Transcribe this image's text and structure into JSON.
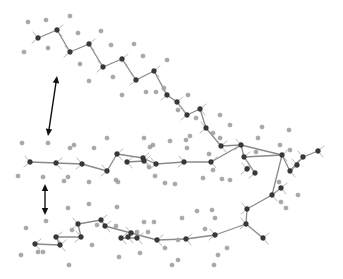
{
  "figure": {
    "type": "ball-and-stick molecular structure",
    "colors": {
      "background": "#ffffff",
      "carbon": "#3a3a3a",
      "hydrogen": "#a8a8a8",
      "bond": "#8a8a8a",
      "arrow": "#111111"
    }
  },
  "arrows": [
    {
      "name": "spacing-arrow-upper",
      "x1": 57,
      "y1": 76,
      "x2": 48,
      "y2": 136
    },
    {
      "name": "spacing-arrow-lower",
      "x1": 45,
      "y1": 184,
      "x2": 45,
      "y2": 215
    }
  ],
  "chains": [
    {
      "name": "top-chain",
      "carbons": [
        [
          38,
          38
        ],
        [
          57,
          30
        ],
        [
          70,
          52
        ],
        [
          89,
          44
        ],
        [
          103,
          67
        ],
        [
          122,
          59
        ],
        [
          136,
          80
        ],
        [
          154,
          71
        ],
        [
          167,
          95
        ],
        [
          177,
          102
        ],
        [
          187,
          115
        ],
        [
          200,
          109
        ],
        [
          206,
          128
        ],
        [
          221,
          146
        ]
      ],
      "hydrogens": [
        [
          28,
          22
        ],
        [
          46,
          20
        ],
        [
          70,
          16
        ],
        [
          24,
          52
        ],
        [
          48,
          48
        ],
        [
          78,
          33
        ],
        [
          101,
          31
        ],
        [
          80,
          64
        ],
        [
          111,
          45
        ],
        [
          134,
          44
        ],
        [
          89,
          81
        ],
        [
          113,
          77
        ],
        [
          122,
          95
        ],
        [
          143,
          56
        ],
        [
          167,
          60
        ],
        [
          146,
          92
        ],
        [
          156,
          92
        ],
        [
          164,
          88
        ],
        [
          178,
          110
        ],
        [
          188,
          95
        ],
        [
          190,
          136
        ],
        [
          196,
          118
        ],
        [
          220,
          115
        ],
        [
          213,
          133
        ],
        [
          230,
          125
        ]
      ]
    },
    {
      "name": "middle-chain",
      "carbons": [
        [
          30,
          162
        ],
        [
          56,
          163
        ],
        [
          82,
          164
        ],
        [
          107,
          171
        ],
        [
          117,
          154
        ],
        [
          127,
          162
        ],
        [
          143,
          158
        ],
        [
          144,
          161
        ],
        [
          156,
          164
        ],
        [
          184,
          162
        ],
        [
          211,
          162
        ],
        [
          241,
          145
        ],
        [
          244,
          157
        ],
        [
          247,
          169
        ],
        [
          255,
          173
        ],
        [
          282,
          155
        ],
        [
          290,
          171
        ],
        [
          297,
          165
        ],
        [
          303,
          157
        ],
        [
          318,
          151
        ],
        [
          272,
          195
        ],
        [
          281,
          188
        ]
      ],
      "hydrogens": [
        [
          22,
          143
        ],
        [
          48,
          143
        ],
        [
          18,
          176
        ],
        [
          43,
          177
        ],
        [
          70,
          148
        ],
        [
          74,
          145
        ],
        [
          64,
          181
        ],
        [
          68,
          177
        ],
        [
          89,
          182
        ],
        [
          94,
          148
        ],
        [
          107,
          138
        ],
        [
          116,
          180
        ],
        [
          118,
          182
        ],
        [
          144,
          138
        ],
        [
          150,
          147
        ],
        [
          149,
          167
        ],
        [
          155,
          176
        ],
        [
          153,
          145
        ],
        [
          165,
          183
        ],
        [
          175,
          184
        ],
        [
          170,
          141
        ],
        [
          187,
          148
        ],
        [
          203,
          178
        ],
        [
          186,
          140
        ],
        [
          209,
          154
        ],
        [
          213,
          170
        ],
        [
          220,
          138
        ],
        [
          222,
          179
        ],
        [
          230,
          180
        ],
        [
          258,
          138
        ],
        [
          256,
          152
        ],
        [
          262,
          127
        ],
        [
          280,
          145
        ],
        [
          289,
          130
        ],
        [
          290,
          150
        ],
        [
          279,
          182
        ],
        [
          286,
          208
        ],
        [
          298,
          195
        ],
        [
          281,
          202
        ],
        [
          248,
          168
        ]
      ]
    },
    {
      "name": "bottom-chain",
      "carbons": [
        [
          35,
          244
        ],
        [
          56,
          237
        ],
        [
          60,
          245
        ],
        [
          78,
          224
        ],
        [
          81,
          237
        ],
        [
          101,
          220
        ],
        [
          105,
          226
        ],
        [
          121,
          238
        ],
        [
          128,
          237
        ],
        [
          131,
          233
        ],
        [
          137,
          238
        ],
        [
          157,
          240
        ],
        [
          186,
          239
        ],
        [
          215,
          235
        ],
        [
          246,
          224
        ],
        [
          247,
          209
        ],
        [
          263,
          238
        ]
      ],
      "hydrogens": [
        [
          26,
          228
        ],
        [
          21,
          255
        ],
        [
          38,
          252
        ],
        [
          43,
          252
        ],
        [
          46,
          221
        ],
        [
          68,
          208
        ],
        [
          69,
          265
        ],
        [
          72,
          230
        ],
        [
          89,
          204
        ],
        [
          92,
          245
        ],
        [
          97,
          225
        ],
        [
          117,
          207
        ],
        [
          116,
          226
        ],
        [
          119,
          257
        ],
        [
          140,
          253
        ],
        [
          144,
          222
        ],
        [
          148,
          232
        ],
        [
          154,
          222
        ],
        [
          137,
          232
        ],
        [
          165,
          248
        ],
        [
          178,
          240
        ],
        [
          182,
          218
        ],
        [
          197,
          211
        ],
        [
          205,
          229
        ],
        [
          212,
          210
        ],
        [
          215,
          218
        ],
        [
          218,
          255
        ],
        [
          214,
          265
        ],
        [
          172,
          265
        ],
        [
          178,
          260
        ],
        [
          227,
          248
        ]
      ]
    }
  ],
  "bonds": [
    [
      38,
      38,
      57,
      30
    ],
    [
      57,
      30,
      70,
      52
    ],
    [
      70,
      52,
      89,
      44
    ],
    [
      89,
      44,
      103,
      67
    ],
    [
      103,
      67,
      122,
      59
    ],
    [
      122,
      59,
      136,
      80
    ],
    [
      136,
      80,
      154,
      71
    ],
    [
      154,
      71,
      167,
      95
    ],
    [
      167,
      95,
      177,
      102
    ],
    [
      177,
      102,
      187,
      115
    ],
    [
      187,
      115,
      200,
      109
    ],
    [
      200,
      109,
      206,
      128
    ],
    [
      206,
      128,
      221,
      146
    ],
    [
      221,
      146,
      241,
      145
    ],
    [
      30,
      162,
      56,
      163
    ],
    [
      56,
      163,
      82,
      164
    ],
    [
      82,
      164,
      107,
      171
    ],
    [
      107,
      171,
      117,
      154
    ],
    [
      117,
      154,
      143,
      158
    ],
    [
      127,
      162,
      144,
      161
    ],
    [
      143,
      158,
      156,
      164
    ],
    [
      156,
      164,
      184,
      162
    ],
    [
      184,
      162,
      211,
      162
    ],
    [
      211,
      162,
      241,
      145
    ],
    [
      241,
      145,
      244,
      157
    ],
    [
      244,
      157,
      255,
      173
    ],
    [
      241,
      145,
      282,
      155
    ],
    [
      244,
      157,
      282,
      155
    ],
    [
      282,
      155,
      290,
      171
    ],
    [
      282,
      155,
      272,
      195
    ],
    [
      290,
      171,
      303,
      157
    ],
    [
      303,
      157,
      318,
      151
    ],
    [
      290,
      171,
      297,
      165
    ],
    [
      272,
      195,
      281,
      188
    ],
    [
      272,
      195,
      247,
      209
    ],
    [
      35,
      244,
      60,
      245
    ],
    [
      60,
      245,
      56,
      237
    ],
    [
      56,
      237,
      81,
      237
    ],
    [
      81,
      237,
      78,
      224
    ],
    [
      78,
      224,
      101,
      220
    ],
    [
      101,
      220,
      105,
      226
    ],
    [
      105,
      226,
      131,
      233
    ],
    [
      121,
      238,
      137,
      238
    ],
    [
      131,
      233,
      157,
      240
    ],
    [
      157,
      240,
      186,
      239
    ],
    [
      186,
      239,
      215,
      235
    ],
    [
      215,
      235,
      246,
      224
    ],
    [
      246,
      224,
      247,
      209
    ],
    [
      246,
      224,
      263,
      238
    ]
  ]
}
